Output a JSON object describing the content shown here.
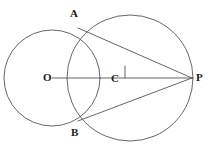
{
  "figure": {
    "type": "geometry-diagram",
    "stroke_color": "#555555",
    "label_color": "#1a1a1a",
    "background_color": "#ffffff",
    "canvas": {
      "width": 212,
      "height": 156
    },
    "labels": {
      "A": "A",
      "B": "B",
      "O": "O",
      "C": "C",
      "P": "P"
    },
    "points": [
      {
        "name": "A",
        "label": "A",
        "x": 78,
        "y": 28
      },
      {
        "name": "B",
        "label": "B",
        "x": 78,
        "y": 121
      },
      {
        "name": "O",
        "label": "O",
        "x": 52,
        "y": 78
      },
      {
        "name": "C",
        "label": "C",
        "x": 118,
        "y": 78
      },
      {
        "name": "P",
        "label": "P",
        "x": 192,
        "y": 78
      }
    ],
    "circles": [
      {
        "name": "circle-O",
        "cx": 52,
        "cy": 78,
        "r": 48
      },
      {
        "name": "circle-right",
        "cx": 130,
        "cy": 78,
        "r": 63
      }
    ],
    "segments": [
      {
        "name": "segment-OP",
        "x1": 52,
        "y1": 78,
        "x2": 192,
        "y2": 78
      },
      {
        "name": "segment-AP",
        "x1": 78,
        "y1": 28,
        "x2": 192,
        "y2": 78
      },
      {
        "name": "segment-BP",
        "x1": 78,
        "y1": 121,
        "x2": 192,
        "y2": 78
      }
    ],
    "tick_marks": [
      {
        "name": "tick-mark-right-of-C",
        "x1": 125,
        "y1": 66,
        "x2": 125,
        "y2": 78
      }
    ]
  }
}
